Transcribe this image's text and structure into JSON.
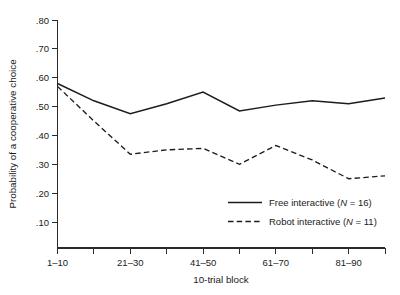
{
  "chart_data": {
    "type": "line",
    "title": "",
    "xlabel": "10-trial block",
    "ylabel": "Probability of a cooperative choice",
    "x": [
      1,
      2,
      3,
      4,
      5,
      6,
      7,
      8,
      9,
      10
    ],
    "categories": [
      "1-10",
      "11-20",
      "21-30",
      "31-40",
      "41-50",
      "51-60",
      "61-70",
      "71-80",
      "81-90",
      "91-100"
    ],
    "xtick_labels": [
      "1–10",
      "21–30",
      "41–50",
      "61–70",
      "81–90"
    ],
    "xtick_label_positions": [
      1,
      3,
      5,
      7,
      9
    ],
    "ytick_labels": [
      ".80",
      ".70",
      ".60",
      ".50",
      ".40",
      ".30",
      ".20",
      ".10"
    ],
    "ytick_values": [
      0.8,
      0.7,
      0.6,
      0.5,
      0.4,
      0.3,
      0.2,
      0.1
    ],
    "ylim": [
      0.1,
      0.8
    ],
    "xlim": [
      1,
      10
    ],
    "grid": false,
    "legend_position": "center-right",
    "series": [
      {
        "name": "Free interactive (N = 16)",
        "style": "solid",
        "values": [
          0.58,
          0.52,
          0.475,
          0.51,
          0.55,
          0.485,
          0.505,
          0.52,
          0.51,
          0.53
        ]
      },
      {
        "name": "Robot interactive (N = 11)",
        "style": "dashed",
        "values": [
          0.57,
          0.45,
          0.335,
          0.35,
          0.355,
          0.3,
          0.365,
          0.315,
          0.25,
          0.26
        ]
      }
    ]
  },
  "legend": {
    "entries": [
      {
        "label_prefix": "Free interactive (",
        "label_italic": "N",
        "label_suffix": " = 16)",
        "style": "solid"
      },
      {
        "label_prefix": "Robot interactive (",
        "label_italic": "N",
        "label_suffix": " = 11)",
        "style": "dashed"
      }
    ]
  },
  "colors": {
    "line": "#1c1c1c",
    "axis": "#2b2b2b",
    "background": "#ffffff",
    "text": "#1a1a1a"
  }
}
